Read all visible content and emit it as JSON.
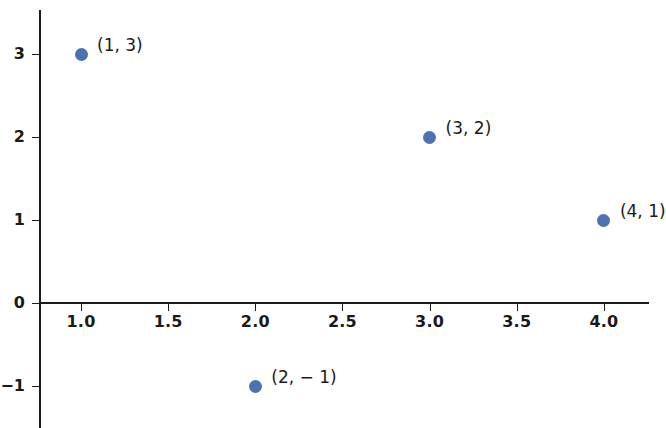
{
  "chart_data": {
    "type": "scatter",
    "title": "",
    "xlabel": "",
    "ylabel": "",
    "grid": false,
    "legend": null,
    "xlim": [
      0.75,
      4.45
    ],
    "ylim": [
      -1.55,
      3.45
    ],
    "x_ticks": [
      "1.0",
      "1.5",
      "2.0",
      "2.5",
      "3.0",
      "3.5",
      "4.0"
    ],
    "x_tick_values": [
      1.0,
      1.5,
      2.0,
      2.5,
      3.0,
      3.5,
      4.0
    ],
    "y_ticks": [
      "3",
      "2",
      "1",
      "0",
      "−1"
    ],
    "y_tick_values": [
      3,
      2,
      1,
      0,
      -1
    ],
    "marker_color": "#4c72b0",
    "axis_color": "#1a1a1a",
    "background_color": "#ffffff",
    "points": [
      {
        "x": 1,
        "y": 3,
        "label": "(1, 3)"
      },
      {
        "x": 3,
        "y": 2,
        "label": "(3, 2)"
      },
      {
        "x": 4,
        "y": 1,
        "label": "(4, 1)"
      },
      {
        "x": 2,
        "y": -1,
        "label": "(2, − 1)"
      }
    ],
    "series": [
      {
        "name": "points",
        "x": [
          1,
          2,
          3,
          4
        ],
        "y": [
          3,
          -1,
          2,
          1
        ]
      }
    ]
  }
}
